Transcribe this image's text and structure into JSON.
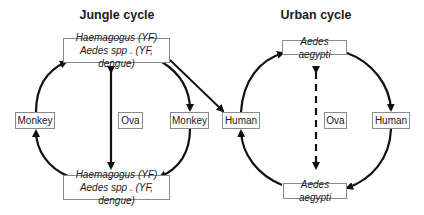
{
  "jungle": {
    "title": "Jungle cycle",
    "vector_top": {
      "line1": "Haemagogus  (YF)",
      "line2": "Aedes spp . (YF, dengue)"
    },
    "vector_bottom": {
      "line1": "Haemagogus  (YF)",
      "line2": "Aedes spp . (YF, dengue)"
    },
    "host_left": "Monkey",
    "host_right": "Monkey",
    "center": "Ova"
  },
  "urban": {
    "title": "Urban cycle",
    "vector_top": "Aedes  aegypti",
    "vector_bottom": "Aedes  aegypti",
    "host_left": "Human",
    "host_right": "Human",
    "center": "Ova"
  },
  "colors": {
    "line": "#111111",
    "box_border": "#8a8a8a"
  }
}
